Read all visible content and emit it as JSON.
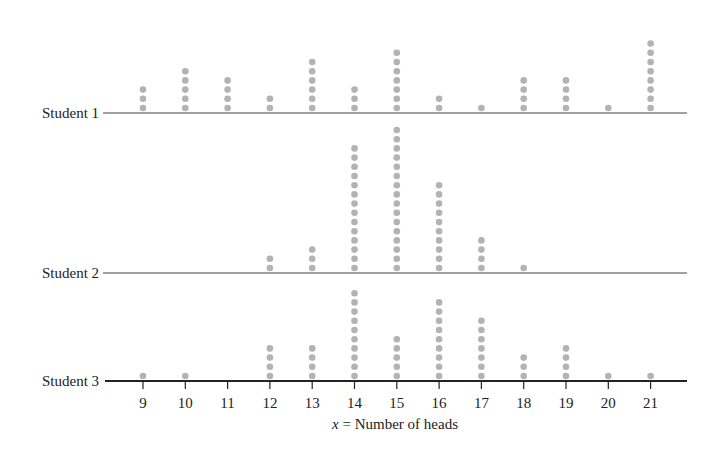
{
  "chart_data": {
    "type": "dotplot",
    "title": "",
    "xlabel": "x = Number of heads",
    "xlabel_var": "x",
    "xlabel_rest": " = Number of heads",
    "ylabel": "",
    "x": [
      9,
      10,
      11,
      12,
      13,
      14,
      15,
      16,
      17,
      18,
      19,
      20,
      21
    ],
    "xlim": [
      9,
      21
    ],
    "grid": false,
    "legend": "none",
    "series": [
      {
        "name": "Student 1",
        "values": [
          3,
          5,
          4,
          2,
          6,
          3,
          7,
          2,
          1,
          4,
          4,
          1,
          8
        ]
      },
      {
        "name": "Student 2",
        "values": [
          0,
          0,
          0,
          2,
          3,
          14,
          16,
          10,
          4,
          1,
          0,
          0,
          0
        ]
      },
      {
        "name": "Student 3",
        "values": [
          1,
          1,
          0,
          4,
          4,
          10,
          5,
          9,
          7,
          3,
          4,
          1,
          1
        ]
      }
    ],
    "dot_color": "#b3b3b3",
    "axis_color": "#222222"
  },
  "labels": {
    "student1": "Student 1",
    "student2": "Student 2",
    "student3": "Student 3"
  }
}
